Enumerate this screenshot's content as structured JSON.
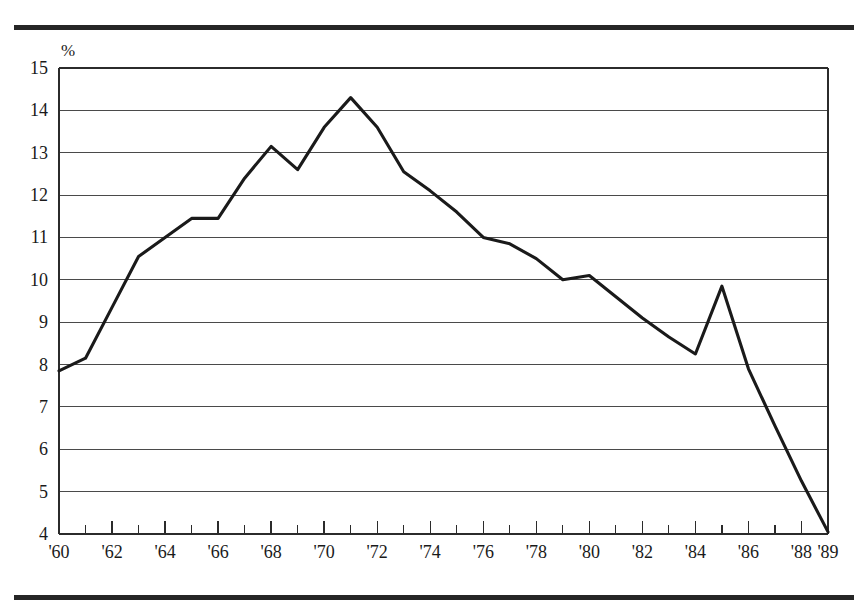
{
  "figure": {
    "background_color": "#ffffff",
    "rule_color": "#262626",
    "line_color": "#1a1a1a",
    "grid_color": "#4a4a4a",
    "axis_color": "#2b2b2b"
  },
  "chart_data": {
    "type": "line",
    "title": "",
    "subtitle": "",
    "xlabel": "",
    "ylabel": "",
    "unit_label": "%",
    "grid": true,
    "legend": null,
    "xlim": [
      1960,
      1989
    ],
    "ylim": [
      4,
      15
    ],
    "y_ticks": [
      4,
      5,
      6,
      7,
      8,
      9,
      10,
      11,
      12,
      13,
      14,
      15
    ],
    "y_tick_labels": [
      "4",
      "5",
      "6",
      "7",
      "8",
      "9",
      "10",
      "11",
      "12",
      "13",
      "14",
      "15"
    ],
    "x_ticks": [
      1960,
      1961,
      1962,
      1963,
      1964,
      1965,
      1966,
      1967,
      1968,
      1969,
      1970,
      1971,
      1972,
      1973,
      1974,
      1975,
      1976,
      1977,
      1978,
      1979,
      1980,
      1981,
      1982,
      1983,
      1984,
      1985,
      1986,
      1987,
      1988,
      1989
    ],
    "x_tick_labels": [
      {
        "year": 1960,
        "label": "'60"
      },
      {
        "year": 1962,
        "label": "'62"
      },
      {
        "year": 1964,
        "label": "'64"
      },
      {
        "year": 1966,
        "label": "'66"
      },
      {
        "year": 1968,
        "label": "'68"
      },
      {
        "year": 1970,
        "label": "'70"
      },
      {
        "year": 1972,
        "label": "'72"
      },
      {
        "year": 1974,
        "label": "'74"
      },
      {
        "year": 1976,
        "label": "'76"
      },
      {
        "year": 1978,
        "label": "'78"
      },
      {
        "year": 1980,
        "label": "'80"
      },
      {
        "year": 1982,
        "label": "'82"
      },
      {
        "year": 1984,
        "label": "'84"
      },
      {
        "year": 1986,
        "label": "'86"
      },
      {
        "year": 1988,
        "label": "'88"
      },
      {
        "year": 1989,
        "label": "'89"
      }
    ],
    "x": [
      1960,
      1961,
      1962,
      1963,
      1964,
      1965,
      1966,
      1967,
      1968,
      1969,
      1970,
      1971,
      1972,
      1973,
      1974,
      1975,
      1976,
      1977,
      1978,
      1979,
      1980,
      1981,
      1982,
      1983,
      1984,
      1985,
      1986,
      1987,
      1988,
      1989
    ],
    "values": [
      7.85,
      8.15,
      9.35,
      10.55,
      11.0,
      11.45,
      11.45,
      12.4,
      13.15,
      12.6,
      13.6,
      14.3,
      13.6,
      12.55,
      12.1,
      11.6,
      11.0,
      10.85,
      10.5,
      10.0,
      10.1,
      9.6,
      9.1,
      8.65,
      8.25,
      9.85,
      7.9,
      6.55,
      5.25,
      4.05
    ],
    "series_name": ""
  }
}
